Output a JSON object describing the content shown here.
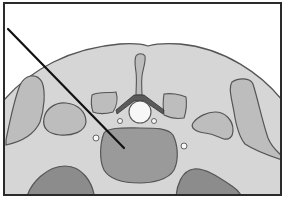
{
  "diagram": {
    "type": "anatomical-cross-section",
    "labels": [],
    "colors": {
      "background": "#ffffff",
      "frame": "#2a2a2a",
      "body_fill": "#d6d6d6",
      "body_outline": "#555555",
      "muscle_fill": "#bdbdbd",
      "vertebral_body_fill": "#9a9a9a",
      "organ_dark_fill": "#8c8c8c",
      "lamina_fill": "#5a5a5a",
      "canal_fill": "#f7f7f7",
      "pointer": "#111111"
    },
    "pointer": {
      "x1": 8,
      "y1": 29,
      "x2": 124,
      "y2": 148
    }
  }
}
